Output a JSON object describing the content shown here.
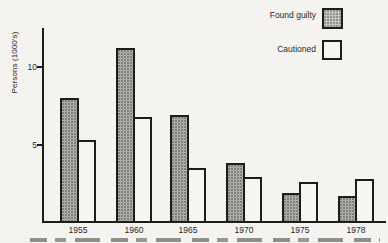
{
  "figure": {
    "kind": "scanned textbook bar chart",
    "caption_note": "caption line cut off at bottom edge (illegible glyph tops only)"
  },
  "chart_data": {
    "type": "bar",
    "title": "",
    "xlabel": "",
    "ylabel": "Persons (1000's)",
    "categories": [
      "1955",
      "1960",
      "1965",
      "1970",
      "1975",
      "1978"
    ],
    "series": [
      {
        "name": "Found guilty",
        "style": "gray-hatched",
        "values": [
          8.0,
          11.2,
          6.9,
          3.8,
          1.9,
          1.7
        ]
      },
      {
        "name": "Cautioned",
        "style": "white",
        "values": [
          5.3,
          6.8,
          3.5,
          2.9,
          2.6,
          2.8
        ]
      }
    ],
    "ylim": [
      0,
      12.5
    ],
    "yticks": [
      {
        "value": 10,
        "label": "10"
      },
      {
        "value": 5,
        "label": "5"
      }
    ],
    "grid": false,
    "legend_position": "top-right"
  },
  "legend": {
    "items": [
      {
        "label": "Found guilty",
        "swatch": "gray-hatched"
      },
      {
        "label": "Cautioned",
        "swatch": "white"
      }
    ]
  },
  "colors": {
    "paper": "#f4f3f0",
    "axis": "#1d1c1a",
    "bar_gray_fill": "#d3d2ce",
    "bar_gray_dots": "#686762",
    "bar_white_fill": "#f6f5f2",
    "bar_border": "#1d1c1a",
    "text": "#2a2927"
  }
}
